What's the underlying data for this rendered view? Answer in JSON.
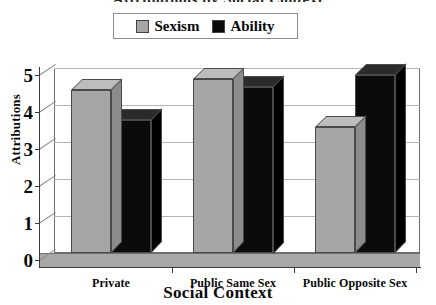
{
  "title_fragment": "Attributions by Social Context",
  "legend": {
    "position": "top-center",
    "entries": [
      {
        "label": "Sexism",
        "color": "#a6a6a6",
        "swatch": "legend-swatch-sexism"
      },
      {
        "label": "Ability",
        "color": "#0b0b0b",
        "swatch": "legend-swatch-ability"
      }
    ]
  },
  "axes": {
    "ylabel": "Attributions",
    "xlabel": "Social Context",
    "yticks": [
      "0",
      "1",
      "2",
      "3",
      "4",
      "5"
    ]
  },
  "chart_data": {
    "type": "bar",
    "title": "",
    "xlabel": "Social Context",
    "ylabel": "Attributions",
    "categories": [
      "Private",
      "Public Same Sex",
      "Public Opposite Sex"
    ],
    "series": [
      {
        "name": "Sexism",
        "color": "#a6a6a6",
        "values": [
          4.4,
          4.7,
          3.4
        ]
      },
      {
        "name": "Ability",
        "color": "#0b0b0b",
        "values": [
          3.6,
          4.5,
          4.8
        ]
      }
    ],
    "ylim": [
      0,
      5
    ],
    "ytick_step": 1,
    "grid": true,
    "legend_position": "top-center",
    "style": "3d-column"
  }
}
